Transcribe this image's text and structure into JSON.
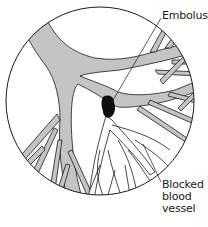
{
  "diagram": {
    "labels": {
      "embolus": "Embolus",
      "blocked_line1": "Blocked",
      "blocked_line2": "blood",
      "blocked_line3": "vessel"
    },
    "colors": {
      "outline": "#1a1a1a",
      "upstream_vessel_fill": "#c4c4c4",
      "downstream_vessel_fill": "#ffffff",
      "embolus_fill": "#0d0d0d",
      "background": "#ffffff"
    },
    "circle": {
      "cx": 100,
      "cy": 101,
      "r": 94
    },
    "embolus_position": {
      "x": 107,
      "y": 108
    }
  },
  "footer": {
    "fragment": ""
  }
}
